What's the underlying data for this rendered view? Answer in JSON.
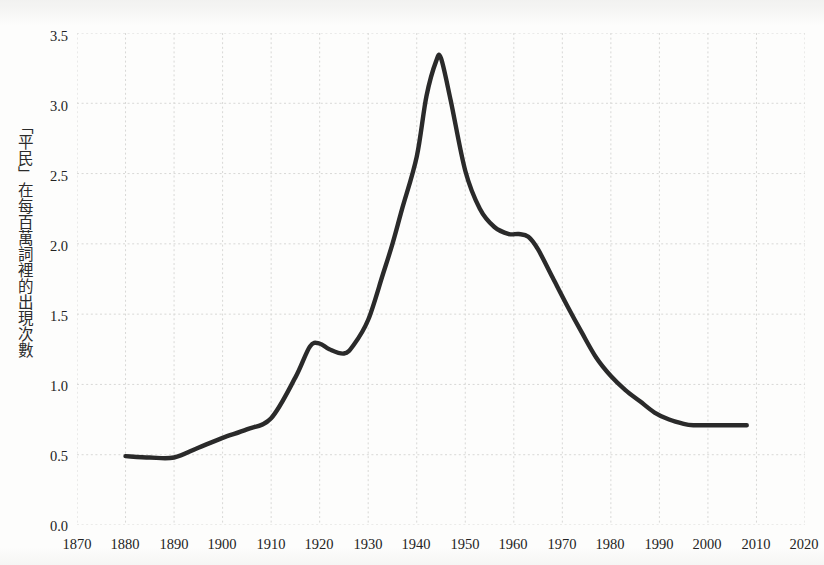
{
  "figure": {
    "background_color": "#fdfdfc",
    "title": "",
    "subtitle": ""
  },
  "axes": {
    "y_label": "「平民」在每百萬詞裡的出現次數",
    "x_label": "",
    "y_ticks": [
      "0.0",
      "0.5",
      "1.0",
      "1.5",
      "2.0",
      "2.5",
      "3.0",
      "3.5"
    ],
    "x_ticks": [
      "1870",
      "1880",
      "1890",
      "1900",
      "1910",
      "1920",
      "1930",
      "1940",
      "1950",
      "1960",
      "1970",
      "1980",
      "1990",
      "2000",
      "2010",
      "2020"
    ],
    "grid_color": "#d8d8d6",
    "tick_color": "#232323"
  },
  "series_style": {
    "line_color": "#2a2a2a",
    "line_width": 4.4
  },
  "chart_data": {
    "type": "line",
    "title": "",
    "xlabel": "",
    "ylabel": "「平民」在每百萬詞裡的出現次數",
    "xlim": [
      1870,
      2020
    ],
    "ylim": [
      0.0,
      3.5
    ],
    "xticks": [
      1870,
      1880,
      1890,
      1900,
      1910,
      1920,
      1930,
      1940,
      1950,
      1960,
      1970,
      1980,
      1990,
      2000,
      2010,
      2020
    ],
    "yticks": [
      0.0,
      0.5,
      1.0,
      1.5,
      2.0,
      2.5,
      3.0,
      3.5
    ],
    "grid": true,
    "legend": null,
    "legend_position": "none",
    "series": [
      {
        "name": "「平民」",
        "color": "#2a2a2a",
        "x": [
          1880,
          1885,
          1890,
          1895,
          1900,
          1905,
          1910,
          1915,
          1918,
          1920,
          1922,
          1925,
          1927,
          1930,
          1933,
          1935,
          1937,
          1940,
          1942,
          1944,
          1945,
          1947,
          1950,
          1953,
          1956,
          1959,
          1961,
          1963,
          1965,
          1968,
          1971,
          1974,
          1977,
          1980,
          1983,
          1986,
          1989,
          1992,
          1995,
          1997,
          2000,
          2004,
          2008
        ],
        "y": [
          0.49,
          0.48,
          0.48,
          0.55,
          0.62,
          0.68,
          0.76,
          1.05,
          1.27,
          1.29,
          1.25,
          1.22,
          1.28,
          1.46,
          1.78,
          2.0,
          2.25,
          2.62,
          3.05,
          3.3,
          3.32,
          3.02,
          2.52,
          2.25,
          2.12,
          2.07,
          2.07,
          2.05,
          1.96,
          1.76,
          1.56,
          1.37,
          1.19,
          1.06,
          0.96,
          0.88,
          0.8,
          0.75,
          0.72,
          0.71,
          0.71,
          0.71,
          0.71
        ]
      }
    ],
    "annotations": [
      {
        "label": "peak",
        "x": 1945,
        "y": 3.32
      },
      {
        "label": "local-max",
        "x": 1920,
        "y": 1.29
      },
      {
        "label": "local-min",
        "x": 1925,
        "y": 1.22
      },
      {
        "label": "shoulder",
        "x": 1960,
        "y": 2.07
      },
      {
        "label": "start",
        "x": 1880,
        "y": 0.49
      },
      {
        "label": "end",
        "x": 2008,
        "y": 0.71
      }
    ]
  }
}
